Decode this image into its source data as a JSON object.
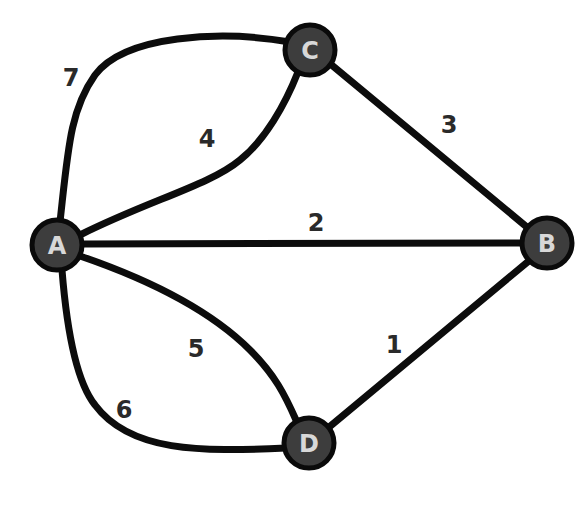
{
  "graph": {
    "nodes": [
      {
        "id": "A",
        "label": "A",
        "x": 57,
        "y": 245
      },
      {
        "id": "B",
        "label": "B",
        "x": 547,
        "y": 243
      },
      {
        "id": "C",
        "label": "C",
        "x": 310,
        "y": 50
      },
      {
        "id": "D",
        "label": "D",
        "x": 309,
        "y": 443
      }
    ],
    "edges": [
      {
        "from": "D",
        "to": "B",
        "weight": "1",
        "label_x": 394,
        "label_y": 345
      },
      {
        "from": "A",
        "to": "B",
        "weight": "2",
        "label_x": 316,
        "label_y": 223
      },
      {
        "from": "C",
        "to": "B",
        "weight": "3",
        "label_x": 449,
        "label_y": 125
      },
      {
        "from": "A",
        "to": "C",
        "weight": "4",
        "label_x": 207,
        "label_y": 139
      },
      {
        "from": "A",
        "to": "D",
        "weight": "5",
        "label_x": 196,
        "label_y": 349
      },
      {
        "from": "A",
        "to": "D",
        "weight": "6",
        "label_x": 124,
        "label_y": 410
      },
      {
        "from": "A",
        "to": "C",
        "weight": "7",
        "label_x": 71,
        "label_y": 78
      }
    ]
  },
  "colors": {
    "node_fill": "#3d3d3d",
    "node_stroke": "#0a0a0a",
    "node_text": "#d8d8d8",
    "edge": "#0c0c0c",
    "edge_label": "#2a2a2a",
    "background": "#ffffff"
  }
}
